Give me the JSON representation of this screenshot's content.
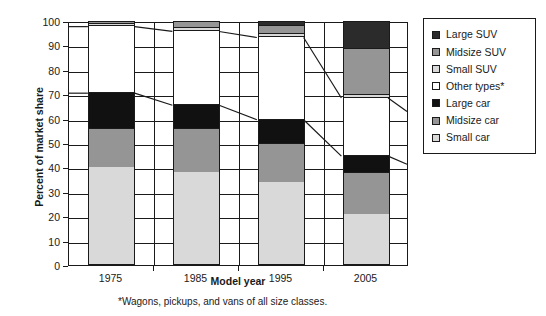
{
  "chart_data": {
    "type": "bar",
    "stacked": true,
    "title": "",
    "xlabel": "Model year",
    "ylabel": "Percent of market share",
    "categories": [
      "1975",
      "1985",
      "1995",
      "2005"
    ],
    "ylim": [
      0,
      100
    ],
    "yticks": [
      0,
      10,
      20,
      30,
      40,
      50,
      60,
      70,
      80,
      90,
      100
    ],
    "grid": true,
    "legend_position": "right",
    "footnote": "*Wagons, pickups, and vans of all size classes.",
    "stack_order_bottom_to_top": [
      "Small car",
      "Midsize car",
      "Large car",
      "Other  types*",
      "Small SUV",
      "Midsize SUV",
      "Large SUV"
    ],
    "series": [
      {
        "name": "Small car",
        "color": "#d9d9d9",
        "values": [
          40.0,
          38.0,
          34.0,
          21.0
        ]
      },
      {
        "name": "Midsize car",
        "color": "#959595",
        "values": [
          16.0,
          18.0,
          16.0,
          17.0
        ]
      },
      {
        "name": "Large car",
        "color": "#111111",
        "values": [
          15.0,
          10.0,
          10.0,
          7.0
        ]
      },
      {
        "name": "Other  types*",
        "color": "#ffffff",
        "values": [
          27.5,
          30.5,
          34.0,
          24.0
        ]
      },
      {
        "name": "Small SUV",
        "color": "#d9d9d9",
        "values": [
          0.6,
          1.0,
          1.0,
          1.0
        ]
      },
      {
        "name": "Midsize SUV",
        "color": "#959595",
        "values": [
          0.9,
          2.5,
          3.5,
          19.0
        ]
      },
      {
        "name": "Large SUV",
        "color": "#2b2b2b",
        "values": [
          0.0,
          0.0,
          1.5,
          11.0
        ]
      }
    ],
    "cumulative_tops": {
      "Small car": [
        40.0,
        38.0,
        34.0,
        21.0
      ],
      "Midsize car": [
        56.0,
        56.0,
        50.0,
        38.0
      ],
      "Large car": [
        71.0,
        66.0,
        60.0,
        45.0
      ],
      "Other  types*": [
        98.5,
        96.5,
        94.0,
        69.0
      ],
      "Small SUV": [
        99.1,
        97.5,
        95.0,
        70.0
      ],
      "Midsize SUV": [
        100.0,
        100.0,
        98.5,
        89.0
      ],
      "Large SUV": [
        100.0,
        100.0,
        100.0,
        100.0
      ]
    },
    "connector_lines": [
      {
        "name": "large-car-top-connector",
        "values": [
          71.0,
          66.0,
          60.0,
          45.0
        ]
      },
      {
        "name": "other-types-top-connector",
        "values": [
          98.5,
          96.5,
          94.0,
          69.0
        ]
      }
    ]
  },
  "legend": {
    "items": [
      {
        "label": "Large SUV",
        "color": "#2b2b2b"
      },
      {
        "label": "Midsize SUV",
        "color": "#959595"
      },
      {
        "label": "Small SUV",
        "color": "#d9d9d9"
      },
      {
        "label": "Other  types*",
        "color": "#ffffff"
      },
      {
        "label": "Large car",
        "color": "#111111"
      },
      {
        "label": "Midsize car",
        "color": "#959595"
      },
      {
        "label": "Small car",
        "color": "#d9d9d9"
      }
    ]
  }
}
